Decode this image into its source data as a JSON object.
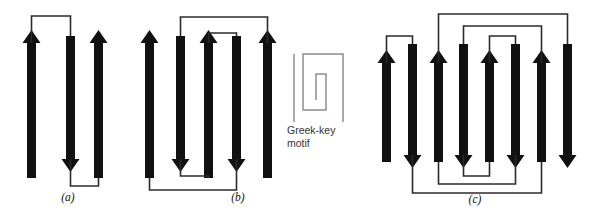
{
  "figure": {
    "background_color": "#ffffff",
    "strand_color": "#111111",
    "connector_color": "#2b2b2b",
    "motif_color": "#8d8d8d"
  },
  "panels": [
    {
      "id": "a",
      "label": "(a)",
      "label_x": 68,
      "label_y": 201,
      "strand_count": 3,
      "strand_width": 9,
      "strands": [
        {
          "index": 1,
          "x": 27,
          "top": 30,
          "bottom": 178,
          "direction": "up"
        },
        {
          "index": 2,
          "x": 66,
          "top": 36,
          "bottom": 172,
          "direction": "down"
        },
        {
          "index": 3,
          "x": 94,
          "top": 30,
          "bottom": 178,
          "direction": "up"
        }
      ],
      "connectors": [
        {
          "from_strand": 1,
          "to_strand": 2,
          "side": "top",
          "y": 16
        },
        {
          "from_strand": 2,
          "to_strand": 3,
          "side": "bottom",
          "y": 186
        }
      ]
    },
    {
      "id": "b",
      "label": "(b)",
      "label_x": 238,
      "label_y": 201,
      "strand_count": 5,
      "strand_width": 9,
      "strands": [
        {
          "index": 1,
          "x": 145,
          "top": 30,
          "bottom": 178,
          "direction": "up"
        },
        {
          "index": 2,
          "x": 176,
          "top": 36,
          "bottom": 172,
          "direction": "down"
        },
        {
          "index": 3,
          "x": 204,
          "top": 30,
          "bottom": 178,
          "direction": "up"
        },
        {
          "index": 4,
          "x": 232,
          "top": 36,
          "bottom": 172,
          "direction": "down"
        },
        {
          "index": 5,
          "x": 263,
          "top": 30,
          "bottom": 178,
          "direction": "up"
        }
      ],
      "connectors": [
        {
          "from_strand": 2,
          "to_strand": 5,
          "side": "top",
          "y": 17
        },
        {
          "from_strand": 3,
          "to_strand": 4,
          "side": "top",
          "y": 33
        },
        {
          "from_strand": 2,
          "to_strand": 3,
          "side": "bottom",
          "y": 176
        },
        {
          "from_strand": 1,
          "to_strand": 4,
          "side": "bottom",
          "y": 190
        }
      ]
    },
    {
      "id": "c",
      "label": "(c)",
      "label_x": 475,
      "label_y": 203,
      "strand_count": 8,
      "strand_width": 9,
      "strands": [
        {
          "index": 1,
          "x": 382,
          "top": 50,
          "bottom": 162,
          "direction": "up"
        },
        {
          "index": 2,
          "x": 408,
          "top": 44,
          "bottom": 168,
          "direction": "down"
        },
        {
          "index": 3,
          "x": 434,
          "top": 50,
          "bottom": 162,
          "direction": "up"
        },
        {
          "index": 4,
          "x": 459,
          "top": 44,
          "bottom": 168,
          "direction": "down"
        },
        {
          "index": 5,
          "x": 485,
          "top": 50,
          "bottom": 162,
          "direction": "up"
        },
        {
          "index": 6,
          "x": 511,
          "top": 44,
          "bottom": 168,
          "direction": "down"
        },
        {
          "index": 7,
          "x": 537,
          "top": 50,
          "bottom": 162,
          "direction": "up"
        },
        {
          "index": 8,
          "x": 563,
          "top": 44,
          "bottom": 168,
          "direction": "down"
        }
      ],
      "connectors": [
        {
          "from_strand": 1,
          "to_strand": 2,
          "side": "top",
          "y": 36
        },
        {
          "from_strand": 5,
          "to_strand": 6,
          "side": "top",
          "y": 36
        },
        {
          "from_strand": 4,
          "to_strand": 7,
          "side": "top",
          "y": 26
        },
        {
          "from_strand": 3,
          "to_strand": 8,
          "side": "top",
          "y": 14
        },
        {
          "from_strand": 4,
          "to_strand": 5,
          "side": "bottom",
          "y": 176
        },
        {
          "from_strand": 3,
          "to_strand": 6,
          "side": "bottom",
          "y": 184
        },
        {
          "from_strand": 2,
          "to_strand": 7,
          "side": "bottom",
          "y": 193
        }
      ]
    }
  ],
  "inset": {
    "id": "greek-key",
    "label_line1": "Greek-key",
    "label_line2": "motif",
    "label_x": 287,
    "label_y1": 134,
    "label_y2": 147,
    "spiral_points": "343,122 343,54 303,54 303,110 326,110 326,74 316,74 316,100",
    "stem_x": 294,
    "stem_top": 54,
    "stem_bottom": 122
  }
}
